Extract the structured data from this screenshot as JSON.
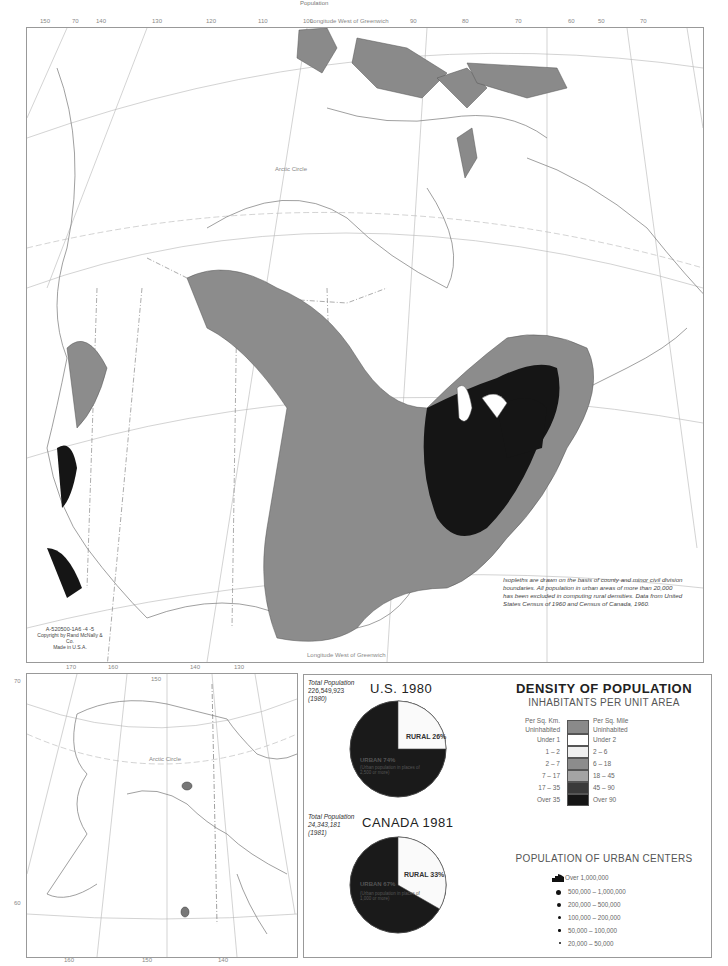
{
  "page": {
    "header_text": "Population"
  },
  "main_map": {
    "top_label": "Longitude West of Greenwich",
    "bottom_label": "Longitude West of Greenwich",
    "top_longitude_ticks": [
      "150",
      "70",
      "140",
      "130",
      "120",
      "110",
      "100",
      "90",
      "80",
      "70",
      "60",
      "50",
      "70",
      "40"
    ],
    "bottom_longitude_ticks": [
      "170",
      "160",
      "110",
      "150",
      "140",
      "130",
      "100",
      "90",
      "80"
    ],
    "left_latitude_ticks": [
      "60",
      "50",
      "40",
      "30"
    ],
    "right_latitude_ticks": [
      "60",
      "50",
      "40",
      "30"
    ],
    "arctic_circle_label": "Arctic Circle",
    "credit": {
      "code": "A-520500-1A6  -4  -5",
      "copyright": "Copyright by Rand McNally & Co.",
      "made_in": "Made in U.S.A."
    },
    "note": "Isopleths are drawn on the basis of county and minor civil division boundaries. All population in urban areas of more than 20,000 has been excluded in computing rural densities. Data from United States Census of 1960 and Census of Canada, 1960."
  },
  "alaska_inset": {
    "top_longitude_ticks": [
      "170",
      "160",
      "150",
      "140",
      "130"
    ],
    "bottom_longitude_ticks": [
      "160",
      "150",
      "140"
    ],
    "left_latitude_ticks": [
      "70",
      "60"
    ],
    "arctic_circle_label": "Arctic Circle"
  },
  "pies": [
    {
      "title": "U.S. 1980",
      "total_label": "Total Population",
      "total_value": "226,549,923",
      "total_year": "(1980)",
      "rural_label": "RURAL 26%",
      "urban_label": "URBAN 74%",
      "urban_sub": "(Urban population in places of 2,500 or more)",
      "rural_pct": 26,
      "urban_pct": 74
    },
    {
      "title": "CANADA 1981",
      "total_label": "Total Population",
      "total_value": "24,343,181",
      "total_year": "(1981)",
      "rural_label": "RURAL 33%",
      "urban_label": "URBAN 67%",
      "urban_sub": "(Urban population in places of 1,000 or more)",
      "rural_pct": 33,
      "urban_pct": 67
    }
  ],
  "density_legend": {
    "title": "DENSITY OF POPULATION",
    "subtitle": "INHABITANTS PER UNIT AREA",
    "left_header": "Per Sq. Km.",
    "right_header": "Per Sq. Mile",
    "rows": [
      {
        "km": "Uninhabited",
        "mile": "Uninhabited",
        "color": "#8a8a8a"
      },
      {
        "km": "Under 1",
        "mile": "Under 2",
        "color": "#ffffff"
      },
      {
        "km": "1 – 2",
        "mile": "2 – 6",
        "color": "#efefef"
      },
      {
        "km": "2 – 7",
        "mile": "6 – 18",
        "color": "#8c8c8c"
      },
      {
        "km": "7 – 17",
        "mile": "18 – 45",
        "color": "#a4a4a4"
      },
      {
        "km": "17 – 35",
        "mile": "45 – 90",
        "color": "#3a3a3a"
      },
      {
        "km": "Over 35",
        "mile": "Over 90",
        "color": "#151515"
      }
    ]
  },
  "urban_legend": {
    "title": "POPULATION OF URBAN CENTERS",
    "rows": [
      {
        "label": "Over 1,000,000",
        "symbol": "urban-area-icon"
      },
      {
        "label": "500,000 – 1,000,000",
        "symbol": "dot-large"
      },
      {
        "label": "200,000 – 500,000",
        "symbol": "dot-medium"
      },
      {
        "label": "100,000 – 200,000",
        "symbol": "dot-small"
      },
      {
        "label": "50,000 – 100,000",
        "symbol": "dot-smaller"
      },
      {
        "label": "20,000 – 50,000",
        "symbol": "dot-smallest"
      }
    ]
  },
  "colors": {
    "uninhabited": "#8a8a8a",
    "dense": "#151515",
    "mid": "#8c8c8c",
    "line": "#999999"
  }
}
